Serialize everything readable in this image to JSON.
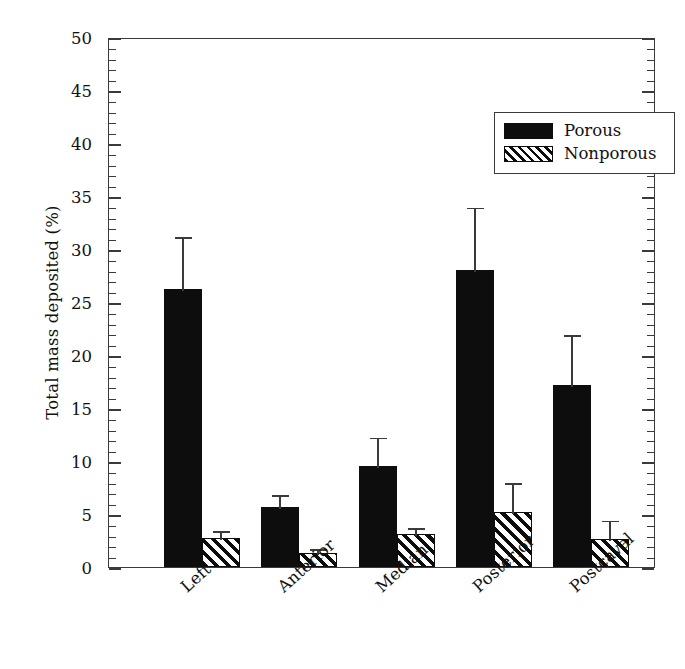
{
  "chart_data": {
    "type": "bar",
    "title": "",
    "xlabel": "",
    "ylabel": "Total mass deposited (%)",
    "categories": [
      "Left",
      "Anterior",
      "Median",
      "Posterior",
      "Postcaval"
    ],
    "series": [
      {
        "name": "Porous",
        "color": "#0d0d0d",
        "fill": "solid",
        "values": [
          26.2,
          5.7,
          9.5,
          28.0,
          17.2
        ],
        "errors": [
          5.0,
          1.2,
          2.8,
          6.0,
          4.8
        ]
      },
      {
        "name": "Nonporous",
        "color": "#0d0d0d",
        "fill": "diagonal-hatch",
        "values": [
          2.7,
          1.3,
          3.1,
          5.2,
          2.6
        ],
        "errors": [
          0.8,
          0.5,
          0.7,
          2.8,
          1.9
        ]
      }
    ],
    "ylim": [
      0,
      50
    ],
    "ytick_major": 5,
    "ytick_minor": 1,
    "ytick_labels": [
      "0",
      "5",
      "10",
      "15",
      "20",
      "25",
      "30",
      "35",
      "40",
      "45",
      "50"
    ],
    "grid": false,
    "legend_position": "top-right",
    "axis_color": "#3a3a3a",
    "background": "#ffffff"
  },
  "legend": {
    "items": [
      {
        "label": "Porous"
      },
      {
        "label": "Nonporous"
      }
    ]
  }
}
